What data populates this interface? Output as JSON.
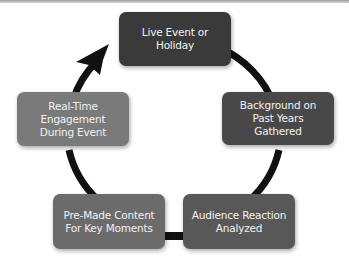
{
  "diagram": {
    "type": "cycle",
    "direction": "clockwise",
    "nodes": [
      {
        "id": "live-event",
        "label": "Live Event or\nHoliday",
        "color": "#3a3a3a"
      },
      {
        "id": "background",
        "label": "Background on\nPast Years\nGathered",
        "color": "#484848"
      },
      {
        "id": "audience-reaction",
        "label": "Audience Reaction\nAnalyzed",
        "color": "#585858"
      },
      {
        "id": "pre-made-content",
        "label": "Pre-Made Content\nFor Key Moments",
        "color": "#6b6b6b"
      },
      {
        "id": "real-time",
        "label": "Real-Time\nEngagement\nDuring Event",
        "color": "#7a7a7a"
      }
    ],
    "connector_color": "#111111",
    "arrow": {
      "from": "real-time",
      "to": "live-event"
    }
  }
}
